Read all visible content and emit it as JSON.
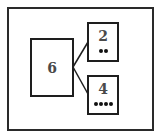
{
  "diagram": {
    "type": "number-bond",
    "whole": {
      "value": "6"
    },
    "parts": [
      {
        "value": "2",
        "dots": 2
      },
      {
        "value": "4",
        "dots": 4
      }
    ]
  },
  "colors": {
    "border": "#1e1e1e",
    "number": "#4a4a4a",
    "dot": "#111111"
  }
}
